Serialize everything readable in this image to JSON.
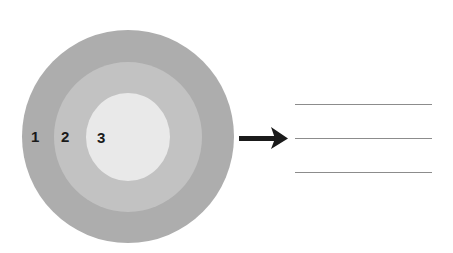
{
  "diagram": {
    "type": "concentric-circles",
    "layers": [
      {
        "label": "1",
        "name": "outer-layer",
        "color": "#adadad"
      },
      {
        "label": "2",
        "name": "middle-layer",
        "color": "#c2c2c2"
      },
      {
        "label": "3",
        "name": "inner-layer",
        "color": "#e9e9e9"
      }
    ],
    "arrow": {
      "direction": "right",
      "color": "#1a1a1a"
    },
    "answer_lines": [
      {
        "value": ""
      },
      {
        "value": ""
      },
      {
        "value": ""
      }
    ]
  }
}
